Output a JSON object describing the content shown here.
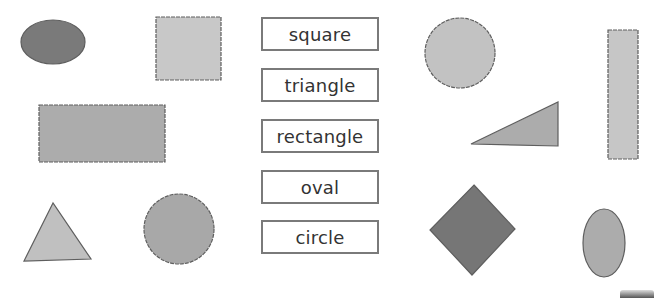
{
  "worksheet": {
    "labels": [
      {
        "text": "square"
      },
      {
        "text": "triangle"
      },
      {
        "text": "rectangle"
      },
      {
        "text": "oval"
      },
      {
        "text": "circle"
      }
    ],
    "colors": {
      "light_fill": "#c4c4c4",
      "medium_fill": "#aaaaaa",
      "dark_fill": "#7a7a7a",
      "outline": "#5e5e5e",
      "label_border": "#7a7a7a",
      "label_text": "#333333"
    },
    "shapes": [
      {
        "type": "oval",
        "position": "top-left"
      },
      {
        "type": "square",
        "position": "top-left-center"
      },
      {
        "type": "rectangle",
        "position": "middle-left"
      },
      {
        "type": "triangle",
        "position": "bottom-left"
      },
      {
        "type": "circle",
        "position": "bottom-left-center"
      },
      {
        "type": "circle",
        "position": "top-right-center"
      },
      {
        "type": "rectangle",
        "position": "right-vertical"
      },
      {
        "type": "triangle",
        "position": "middle-right"
      },
      {
        "type": "square",
        "position": "bottom-right-rotated"
      },
      {
        "type": "oval",
        "position": "bottom-right"
      }
    ]
  }
}
